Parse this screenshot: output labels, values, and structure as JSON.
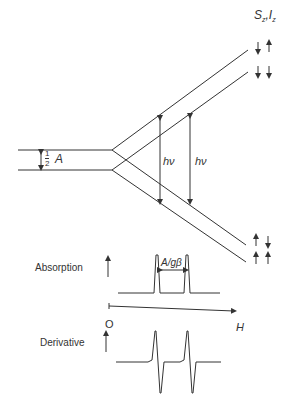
{
  "diagram": {
    "spin_labels": {
      "S": "S",
      "S_sub": "z",
      "sep": ",",
      "I": "I",
      "I_sub": "z"
    },
    "half_A": {
      "num": "1",
      "den": "2",
      "sym": "A"
    },
    "hv_left": "hν",
    "hv_right": "hν",
    "absorption_label": "Absorption",
    "splitting_label": "A/gβ",
    "origin_label": "O",
    "field_label": "H",
    "derivative_label": "Derivative",
    "spin_states": [
      {
        "electron": "down",
        "nuclear": "up"
      },
      {
        "electron": "down",
        "nuclear": "down"
      },
      {
        "electron": "up",
        "nuclear": "down"
      },
      {
        "electron": "up",
        "nuclear": "up"
      }
    ],
    "colors": {
      "line": "#333333",
      "text": "#333333"
    }
  }
}
